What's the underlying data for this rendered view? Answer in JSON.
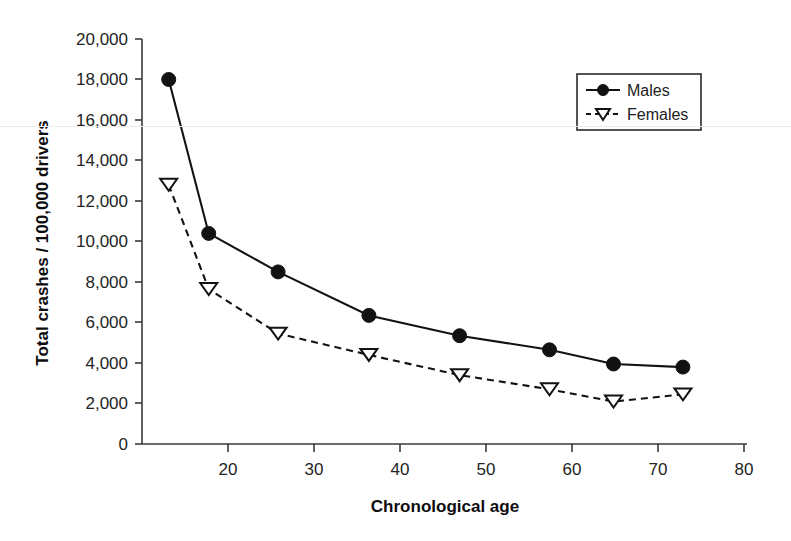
{
  "chart_data": {
    "type": "line",
    "title": "",
    "xlabel": "Chronological age",
    "ylabel": "Total crashes / 100,000 drivers",
    "xlim": [
      14,
      82
    ],
    "ylim": [
      0,
      20000
    ],
    "grid": false,
    "legend_position": "top-right",
    "xticks": [
      20,
      30,
      40,
      50,
      60,
      70,
      80
    ],
    "xtick_labels": [
      "20",
      "30",
      "40",
      "50",
      "60",
      "70",
      "80"
    ],
    "yticks": [
      0,
      2000,
      4000,
      6000,
      8000,
      10000,
      12000,
      14000,
      16000,
      18000,
      20000
    ],
    "ytick_labels": [
      "0",
      "2,000",
      "4,000",
      "6,000",
      "8,000",
      "10,000",
      "12,000",
      "14,000",
      "16,000",
      "18,000",
      "20,000"
    ],
    "series": [
      {
        "name": "Males",
        "marker": "filled-circle",
        "linestyle": "solid",
        "color": "#121212",
        "x": [
          17.0,
          21.5,
          29.3,
          39.5,
          49.7,
          59.8,
          67.0,
          74.8
        ],
        "values": [
          18000,
          10400,
          8500,
          6350,
          5350,
          4650,
          3950,
          3800
        ]
      },
      {
        "name": "Females",
        "marker": "open-down-triangle",
        "linestyle": "dashed",
        "color": "#121212",
        "x": [
          17.0,
          21.5,
          29.3,
          39.5,
          49.7,
          59.8,
          67.0,
          74.8
        ],
        "values": [
          12800,
          7650,
          5450,
          4400,
          3400,
          2700,
          2100,
          2450
        ]
      }
    ]
  },
  "legend": {
    "items": [
      {
        "label": "Males"
      },
      {
        "label": "Females"
      }
    ]
  },
  "colors": {
    "ink": "#121212",
    "axis": "#3a3a3a",
    "background": "#ffffff"
  }
}
